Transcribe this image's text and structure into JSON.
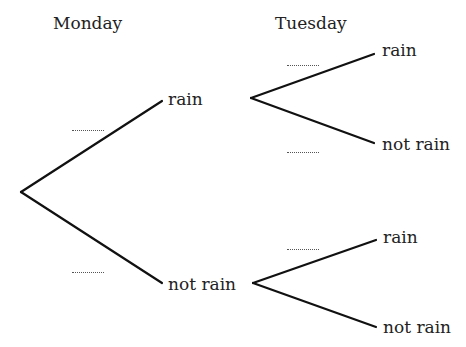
{
  "diagram": {
    "type": "probability-tree",
    "headers": {
      "monday": "Monday",
      "tuesday": "Tuesday"
    },
    "monday_branches": [
      {
        "label": "rain",
        "probability": "........"
      },
      {
        "label": "not rain",
        "probability": "........"
      }
    ],
    "tuesday_branches": {
      "after_rain": [
        {
          "label": "rain",
          "probability": "........"
        },
        {
          "label": "not rain",
          "probability": "........"
        }
      ],
      "after_not_rain": [
        {
          "label": "rain",
          "probability": "........"
        },
        {
          "label": "not rain",
          "probability": ""
        }
      ]
    },
    "colors": {
      "line": "#111111",
      "text": "#222222",
      "dots": "#555555"
    }
  }
}
